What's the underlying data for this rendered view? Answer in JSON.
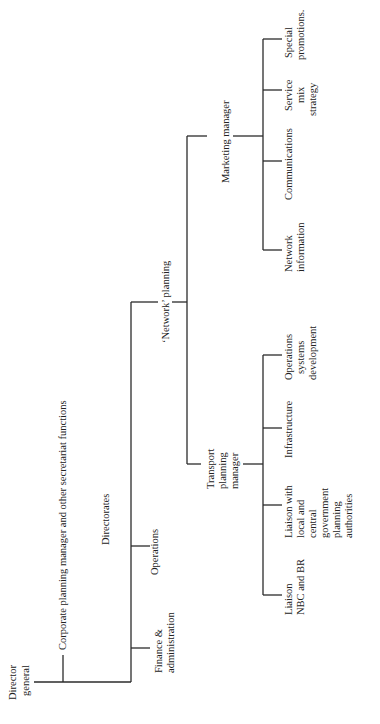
{
  "diagram": {
    "type": "organization-chart",
    "orientation": "rotated-90-ccw",
    "root": {
      "id": "director-general",
      "label": [
        "Director",
        "general"
      ],
      "children": [
        {
          "id": "corporate-planning",
          "label": [
            "Corporate planning manager and other secretariat functions"
          ]
        },
        {
          "id": "directorates-heading",
          "label": [
            "Directorates"
          ]
        },
        {
          "id": "finance-administration",
          "label": [
            "Finance &",
            "administration"
          ]
        },
        {
          "id": "operations",
          "label": [
            "Operations"
          ]
        },
        {
          "id": "network-planning",
          "label": [
            "'Network' planning"
          ],
          "children": [
            {
              "id": "transport-planning-manager",
              "label": [
                "Transport",
                "planning",
                "manager"
              ],
              "children": [
                {
                  "id": "liaison-nbc-br",
                  "label": [
                    "Liaison",
                    "NBC and BR"
                  ]
                },
                {
                  "id": "liaison-local-central",
                  "label": [
                    "Liaison with",
                    "local and",
                    "central",
                    "government",
                    "planning",
                    "authorities"
                  ]
                },
                {
                  "id": "infrastructure",
                  "label": [
                    "Infrastructure"
                  ]
                },
                {
                  "id": "operations-systems-development",
                  "label": [
                    "Operations",
                    "systems",
                    "development"
                  ]
                }
              ]
            },
            {
              "id": "marketing-manager",
              "label": [
                "Marketing manager"
              ],
              "children": [
                {
                  "id": "network-information",
                  "label": [
                    "Network",
                    "information"
                  ]
                },
                {
                  "id": "communications",
                  "label": [
                    "Communications"
                  ]
                },
                {
                  "id": "service-mix-strategy",
                  "label": [
                    "Service",
                    "mix",
                    "strategy"
                  ]
                },
                {
                  "id": "special-promotions",
                  "label": [
                    "Special",
                    "promotions."
                  ]
                }
              ]
            }
          ]
        }
      ]
    }
  },
  "labels": {
    "director_general": [
      "Director",
      "general"
    ],
    "corporate_planning": "Corporate planning manager and other secretariat functions",
    "directorates": "Directorates",
    "finance": [
      "Finance &",
      "administration"
    ],
    "operations": "Operations",
    "network_planning": "‘Network’ planning",
    "transport": [
      "Transport",
      "planning",
      "manager"
    ],
    "liaison_nbc": [
      "Liaison",
      "NBC and BR"
    ],
    "liaison_local": [
      "Liaison with",
      "local and",
      "central",
      "government",
      "planning",
      "authorities"
    ],
    "infrastructure": "Infrastructure",
    "ops_systems": [
      "Operations",
      "systems",
      "development"
    ],
    "marketing": "Marketing manager",
    "network_info": [
      "Network",
      "information"
    ],
    "communications": "Communications",
    "service_mix": [
      "Service",
      "mix",
      "strategy"
    ],
    "special_promotions": [
      "Special",
      "promotions."
    ]
  }
}
